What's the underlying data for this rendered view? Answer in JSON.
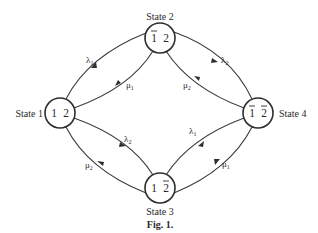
{
  "figure": {
    "caption": "Fig. 1.",
    "type": "state transition diagram"
  },
  "states": [
    {
      "id": "state1",
      "label": "State 1",
      "content": "1 2",
      "component1": "1",
      "component1_failed": false,
      "component2": "2",
      "component2_failed": false
    },
    {
      "id": "state2",
      "label": "State 2",
      "content": "1̄ 2",
      "component1": "1",
      "component1_failed": true,
      "component2": "2",
      "component2_failed": false
    },
    {
      "id": "state3",
      "label": "State 3",
      "content": "1 2̄",
      "component1": "1",
      "component1_failed": false,
      "component2": "2",
      "component2_failed": true
    },
    {
      "id": "state4",
      "label": "State 4",
      "content": "1̄ 2̄",
      "component1": "1",
      "component1_failed": true,
      "component2": "2",
      "component2_failed": true
    }
  ],
  "transitions": [
    {
      "from": "state1",
      "to": "state2",
      "rate": "λ",
      "sub": "1"
    },
    {
      "from": "state2",
      "to": "state1",
      "rate": "μ",
      "sub": "1"
    },
    {
      "from": "state2",
      "to": "state4",
      "rate": "λ",
      "sub": "2"
    },
    {
      "from": "state4",
      "to": "state2",
      "rate": "μ",
      "sub": "2"
    },
    {
      "from": "state1",
      "to": "state3",
      "rate": "λ",
      "sub": "2"
    },
    {
      "from": "state3",
      "to": "state1",
      "rate": "μ",
      "sub": "2"
    },
    {
      "from": "state3",
      "to": "state4",
      "rate": "λ",
      "sub": "1"
    },
    {
      "from": "state4",
      "to": "state3",
      "rate": "μ",
      "sub": "1"
    }
  ],
  "colors": {
    "stroke": "#2e2e2e",
    "background": "#ffffff"
  }
}
